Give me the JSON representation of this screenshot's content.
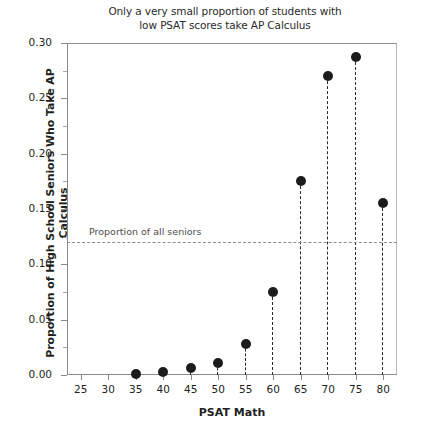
{
  "chart_data": {
    "type": "scatter",
    "title": "Only a very small proportion of students with low PSAT scores take AP Calculus",
    "title_line1": "Only a very small proportion of students with",
    "title_line2": "low PSAT scores take AP Calculus",
    "xlabel": "PSAT Math",
    "ylabel": "Proportion of High School Seniors Who Take AP Calculus",
    "x": [
      35,
      40,
      45,
      50,
      55,
      60,
      65,
      70,
      75,
      80
    ],
    "values": [
      0.001,
      0.003,
      0.006,
      0.011,
      0.028,
      0.075,
      0.175,
      0.27,
      0.287,
      0.155
    ],
    "xlim": [
      22.5,
      82.5
    ],
    "ylim": [
      0.0,
      0.3
    ],
    "xticks": [
      25,
      30,
      35,
      40,
      45,
      50,
      55,
      60,
      65,
      70,
      75,
      80
    ],
    "xtick_labels": [
      "25",
      "30",
      "35",
      "40",
      "45",
      "50",
      "55",
      "60",
      "65",
      "70",
      "75",
      "80"
    ],
    "yticks": [
      0.0,
      0.05,
      0.1,
      0.15,
      0.2,
      0.25,
      0.3
    ],
    "ytick_labels": [
      "0.00",
      "0.05",
      "0.10",
      "0.15",
      "0.20",
      "0.25",
      "0.30"
    ],
    "yticks_minor": [
      0.025,
      0.075,
      0.125,
      0.175,
      0.225,
      0.275
    ],
    "grid": false,
    "legend": "none",
    "marker_color": "#1c1c1c",
    "dropline_style": "dashed",
    "reference_line": {
      "label": "Proportion of all seniors",
      "value": 0.12,
      "style": "dashed",
      "color": "#8d8d8d"
    }
  }
}
